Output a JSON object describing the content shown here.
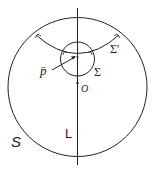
{
  "diagram": {
    "labels": {
      "outer_sphere": "S",
      "line": "L",
      "origin": "O",
      "inner_sphere": "Σ",
      "surface": "Σ'",
      "point": "p̄"
    },
    "colors": {
      "stroke": "#222222",
      "background": "#ffffff"
    }
  }
}
